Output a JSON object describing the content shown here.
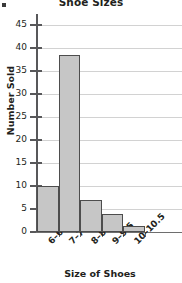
{
  "chart_data": {
    "type": "bar",
    "title": "Shoe Sizes",
    "xlabel": "Size of Shoes",
    "ylabel": "Number Sold",
    "categories": [
      "6–6.5",
      "7–7.5",
      "8–8.5",
      "9–9.5",
      "10–10.5"
    ],
    "values": [
      10,
      38.5,
      7,
      4,
      1.2
    ],
    "ylim": [
      0,
      47.5
    ],
    "yticks": [
      0,
      5,
      10,
      15,
      20,
      25,
      30,
      35,
      40,
      45
    ],
    "ytick_labels": [
      "0",
      "5",
      "10",
      "15",
      "20",
      "25",
      "30",
      "35",
      "40",
      "45"
    ],
    "grid": true,
    "legend": false,
    "bar_fill_color": "#c6c6c6",
    "bar_edge_color": "#4d4d4d",
    "gridline_color": "#d2d2d2",
    "axis_color": "#58585a"
  }
}
